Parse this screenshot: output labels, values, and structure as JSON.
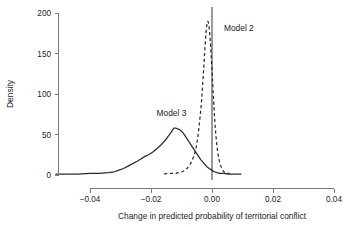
{
  "chart_data": {
    "type": "line",
    "title": "",
    "subtitle": "",
    "xlabel": "Change in predicted probability of territorial conflict",
    "ylabel": "Density",
    "xlim": [
      -0.0512,
      0.0415
    ],
    "ylim": [
      0,
      205
    ],
    "grid": false,
    "legend_position": "inline-annotations",
    "xticks": [
      -0.04,
      -0.02,
      0.0,
      0.02,
      0.04
    ],
    "xticklabels": [
      "-0.04",
      "-0.02",
      "0.00",
      "0.02",
      "0.04"
    ],
    "yticks": [
      0,
      50,
      100,
      150,
      200
    ],
    "yticklabels": [
      "0",
      "50",
      "100",
      "150",
      "200"
    ],
    "annotations": [
      {
        "text": "Model 2",
        "x": 0.0088,
        "y": 178
      },
      {
        "text": "Model 3",
        "x": -0.0133,
        "y": 73
      }
    ],
    "reference_lines": [
      {
        "orientation": "vertical",
        "x": 0.0,
        "color": "#9a9a9a"
      }
    ],
    "series": [
      {
        "name": "Model 2",
        "style": "dashed",
        "color": "#2b2b2b",
        "peak_x": -0.0018,
        "peak_y": 190,
        "points": [
          [
            -0.0157,
            1
          ],
          [
            -0.0148,
            2
          ],
          [
            -0.0138,
            2
          ],
          [
            -0.0128,
            2
          ],
          [
            -0.0118,
            2
          ],
          [
            -0.0108,
            3
          ],
          [
            -0.0098,
            4
          ],
          [
            -0.0088,
            6
          ],
          [
            -0.008,
            9
          ],
          [
            -0.0072,
            13
          ],
          [
            -0.0065,
            18
          ],
          [
            -0.0058,
            25
          ],
          [
            -0.0052,
            34
          ],
          [
            -0.0047,
            45
          ],
          [
            -0.0043,
            58
          ],
          [
            -0.0039,
            72
          ],
          [
            -0.0035,
            88
          ],
          [
            -0.0032,
            104
          ],
          [
            -0.0029,
            120
          ],
          [
            -0.00265,
            136
          ],
          [
            -0.0024,
            152
          ],
          [
            -0.00215,
            166
          ],
          [
            -0.0019,
            178
          ],
          [
            -0.00165,
            187
          ],
          [
            -0.0014,
            190
          ],
          [
            -0.00115,
            188
          ],
          [
            -0.0009,
            181
          ],
          [
            -0.00065,
            170
          ],
          [
            -0.0004,
            156
          ],
          [
            -0.00015,
            140
          ],
          [
            0.0001,
            122
          ],
          [
            0.00035,
            104
          ],
          [
            0.0006,
            87
          ],
          [
            0.00085,
            71
          ],
          [
            0.0011,
            57
          ],
          [
            0.0014,
            44
          ],
          [
            0.0017,
            33
          ],
          [
            0.00205,
            24
          ],
          [
            0.0024,
            17
          ],
          [
            0.0028,
            12
          ],
          [
            0.0032,
            8
          ],
          [
            0.0037,
            5
          ],
          [
            0.0042,
            3
          ],
          [
            0.0048,
            2
          ],
          [
            0.0054,
            2
          ],
          [
            0.0058,
            2
          ]
        ]
      },
      {
        "name": "Model 3",
        "style": "solid",
        "color": "#2b2b2b",
        "peak_x": -0.0125,
        "peak_y": 58,
        "points": [
          [
            -0.0512,
            1
          ],
          [
            -0.048,
            1
          ],
          [
            -0.044,
            1
          ],
          [
            -0.04,
            2
          ],
          [
            -0.037,
            2
          ],
          [
            -0.034,
            3
          ],
          [
            -0.032,
            4
          ],
          [
            -0.0305,
            6
          ],
          [
            -0.029,
            8
          ],
          [
            -0.0275,
            11
          ],
          [
            -0.026,
            14
          ],
          [
            -0.0245,
            17
          ],
          [
            -0.0232,
            20
          ],
          [
            -0.022,
            23
          ],
          [
            -0.0208,
            25
          ],
          [
            -0.0195,
            28
          ],
          [
            -0.0182,
            32
          ],
          [
            -0.017,
            36
          ],
          [
            -0.0158,
            41
          ],
          [
            -0.0147,
            46
          ],
          [
            -0.0137,
            51
          ],
          [
            -0.013,
            55
          ],
          [
            -0.0125,
            58
          ],
          [
            -0.0119,
            58
          ],
          [
            -0.0113,
            57
          ],
          [
            -0.0106,
            56
          ],
          [
            -0.01,
            54
          ],
          [
            -0.0093,
            51
          ],
          [
            -0.0086,
            47
          ],
          [
            -0.0079,
            43
          ],
          [
            -0.0072,
            39
          ],
          [
            -0.0065,
            35
          ],
          [
            -0.0058,
            31
          ],
          [
            -0.0051,
            27
          ],
          [
            -0.0044,
            23
          ],
          [
            -0.0037,
            19
          ],
          [
            -0.003,
            16
          ],
          [
            -0.0023,
            13
          ],
          [
            -0.0016,
            10
          ],
          [
            -0.0009,
            8
          ],
          [
            -0.0001,
            6
          ],
          [
            0.0007,
            4
          ],
          [
            0.0016,
            3
          ],
          [
            0.0026,
            2
          ],
          [
            0.0038,
            2
          ],
          [
            0.0052,
            1
          ],
          [
            0.007,
            1
          ],
          [
            0.0095,
            1
          ]
        ]
      }
    ]
  }
}
